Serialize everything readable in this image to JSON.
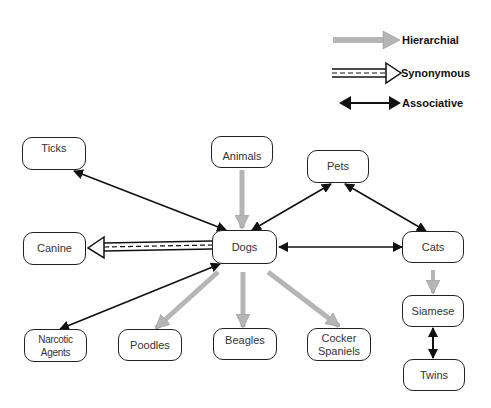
{
  "legend": {
    "hierarchical": "Hierarchial",
    "synonymous": "Synonymous",
    "associative": "Associative"
  },
  "colors": {
    "hierarchical": "#aaaaaa",
    "associative": "#111111",
    "synonymous": "#111111",
    "node_border": "#222222"
  },
  "nodes": {
    "ticks": "Ticks",
    "animals": "Animals",
    "pets": "Pets",
    "canine": "Canine",
    "dogs": "Dogs",
    "cats": "Cats",
    "narcotic_agents": "Narcotic\nAgents",
    "poodles": "Poodles",
    "beagles": "Beagles",
    "cocker_spaniels": "Cocker\nSpaniels",
    "siamese": "Siamese",
    "twins": "Twins"
  },
  "relations": [
    {
      "from": "Animals",
      "to": "Dogs",
      "type": "hierarchical"
    },
    {
      "from": "Dogs",
      "to": "Poodles",
      "type": "hierarchical"
    },
    {
      "from": "Dogs",
      "to": "Beagles",
      "type": "hierarchical"
    },
    {
      "from": "Dogs",
      "to": "Cocker Spaniels",
      "type": "hierarchical"
    },
    {
      "from": "Cats",
      "to": "Siamese",
      "type": "hierarchical"
    },
    {
      "from": "Dogs",
      "to": "Canine",
      "type": "synonymous"
    },
    {
      "from": "Dogs",
      "to": "Ticks",
      "type": "associative"
    },
    {
      "from": "Dogs",
      "to": "Pets",
      "type": "associative"
    },
    {
      "from": "Dogs",
      "to": "Cats",
      "type": "associative"
    },
    {
      "from": "Dogs",
      "to": "Narcotic Agents",
      "type": "associative"
    },
    {
      "from": "Pets",
      "to": "Cats",
      "type": "associative"
    },
    {
      "from": "Siamese",
      "to": "Twins",
      "type": "associative"
    }
  ]
}
